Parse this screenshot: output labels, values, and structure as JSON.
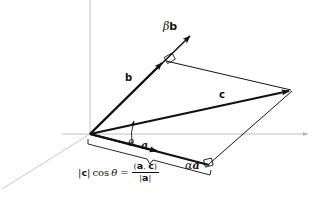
{
  "figure": {
    "background_color": "#ffffff",
    "ink_color": "#111111",
    "axis_color": "#b8b8b8",
    "width": 331,
    "height": 212
  },
  "axes": {
    "origin": {
      "x": 90,
      "y": 134
    },
    "x_axis": {
      "label": "",
      "from_x": 62,
      "to_x": 312,
      "y": 134,
      "arrow": "right"
    },
    "y_axis": {
      "label": "",
      "x": 90,
      "from_y": 0,
      "to_y": 134,
      "arrow": "none"
    },
    "z_axis": {
      "label": "",
      "from_x": 90,
      "from_y": 134,
      "to_x": 0,
      "to_y": 190,
      "arrow": "none"
    }
  },
  "vectors": [
    {
      "name": "a",
      "label": "a",
      "style": "bold-italic-serif",
      "from": {
        "x": 90,
        "y": 134
      },
      "to": {
        "x": 161,
        "y": 153
      },
      "label_pos": {
        "x": 143,
        "y": 145
      },
      "arrowhead": true
    },
    {
      "name": "b",
      "label": "b",
      "style": "bold-sans",
      "from": {
        "x": 90,
        "y": 134
      },
      "to": {
        "x": 165,
        "y": 60
      },
      "label_pos": {
        "x": 128,
        "y": 79
      },
      "arrowhead": true
    },
    {
      "name": "c",
      "label": "c",
      "style": "bold-sans",
      "from": {
        "x": 90,
        "y": 134
      },
      "to": {
        "x": 293,
        "y": 90
      },
      "label_pos": {
        "x": 222,
        "y": 95
      },
      "arrowhead": true
    },
    {
      "name": "beta-b",
      "label_parts": {
        "scalar": "β",
        "vector": "b"
      },
      "label": "βb",
      "style": "italic-greek-bold-vector",
      "from": {
        "x": 90,
        "y": 134
      },
      "to": {
        "x": 193,
        "y": 33
      },
      "label_pos": {
        "x": 167,
        "y": 27
      },
      "arrowhead": true
    },
    {
      "name": "alpha-a",
      "label_parts": {
        "scalar": "α",
        "vector": "a"
      },
      "label": "αa",
      "style": "italic-greek-bold-italic-vector",
      "from": {
        "x": 90,
        "y": 134
      },
      "to": {
        "x": 209,
        "y": 165
      },
      "label_pos": {
        "x": 187,
        "y": 166
      },
      "arrowhead": false
    }
  ],
  "construction_lines": [
    {
      "name": "beta-b-to-c-tip",
      "from": {
        "x": 165,
        "y": 60
      },
      "to": {
        "x": 293,
        "y": 90
      }
    },
    {
      "name": "alpha-a-to-c-tip",
      "from": {
        "x": 209,
        "y": 165
      },
      "to": {
        "x": 293,
        "y": 90
      }
    }
  ],
  "angle_marks": [
    {
      "name": "theta",
      "label": "θ",
      "label_pos": {
        "x": 131,
        "y": 138
      },
      "vertex": {
        "x": 90,
        "y": 134
      }
    }
  ],
  "right_angle_marks": [
    {
      "name": "right-angle-at-beta-b",
      "x": 165,
      "y": 60
    },
    {
      "name": "right-angle-at-alpha-a",
      "x": 209,
      "y": 165
    }
  ],
  "brace": {
    "name": "projection-length-brace",
    "from": {
      "x": 90,
      "y": 141
    },
    "to": {
      "x": 211,
      "y": 172
    }
  },
  "formula": {
    "name": "projection-formula",
    "plain": "|c| cos θ = (a, c) / |a|",
    "lhs": {
      "bar_open": "|",
      "vector": "c",
      "bar_close": "|",
      "function": "cos",
      "angle": "θ"
    },
    "equals": "=",
    "rhs": {
      "numerator_open": "(",
      "numerator_first": "a",
      "numerator_comma": ",",
      "numerator_second": "c",
      "numerator_close": ")",
      "denominator_open": "|",
      "denominator_vector": "a",
      "denominator_close": "|"
    }
  }
}
